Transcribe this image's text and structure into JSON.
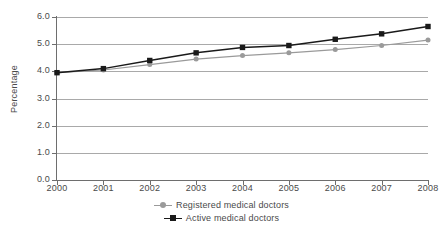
{
  "chart_data": {
    "type": "line",
    "title": "",
    "xlabel": "",
    "ylabel": "Percentage",
    "categories": [
      "2000",
      "2001",
      "2002",
      "2003",
      "2004",
      "2005",
      "2006",
      "2007",
      "2008"
    ],
    "x": [
      2000,
      2001,
      2002,
      2003,
      2004,
      2005,
      2006,
      2007,
      2008
    ],
    "ylim": [
      0.0,
      6.0
    ],
    "ytick_step": 1.0,
    "yticks": [
      "6.0",
      "5.0",
      "4.0",
      "3.0",
      "2.0",
      "1.0",
      "0.0"
    ],
    "ytick_values": [
      6.0,
      5.0,
      4.0,
      3.0,
      2.0,
      1.0,
      0.0
    ],
    "grid": "horizontal",
    "legend_position": "bottom-center",
    "series": [
      {
        "name": "Registered medical doctors",
        "color": "#9a9a9a",
        "marker": "circle",
        "values": [
          3.95,
          4.05,
          4.25,
          4.45,
          4.58,
          4.68,
          4.8,
          4.95,
          5.15
        ]
      },
      {
        "name": "Active medical doctors",
        "color": "#1a1a1a",
        "marker": "square",
        "values": [
          3.95,
          4.1,
          4.4,
          4.68,
          4.88,
          4.95,
          5.18,
          5.38,
          5.65
        ]
      }
    ]
  },
  "legend": {
    "items": [
      {
        "label": "Registered medical doctors",
        "marker_icon": "grey-circle-marker-icon"
      },
      {
        "label": "Active medical doctors",
        "marker_icon": "black-square-marker-icon"
      }
    ]
  }
}
